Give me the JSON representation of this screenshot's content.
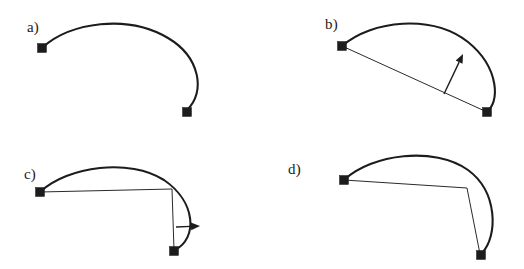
{
  "figure": {
    "background_color": "#ffffff",
    "ink_color": "#1c1c1c",
    "thin_ink_color": "#2a2a2a",
    "width": 524,
    "height": 269
  },
  "panels": [
    {
      "id": "a",
      "label": "a)",
      "label_x": 27,
      "label_y": 32,
      "description": "Smooth open curve between two square endpoints, no chord, no arrow",
      "curve_path": "M 42,48 C 70,22 128,14 168,38 C 200,57 206,92 187,110",
      "chord_path": "",
      "arrow": null,
      "nodes": [
        {
          "name": "start-node",
          "x": 42,
          "y": 48
        },
        {
          "name": "end-node",
          "x": 187,
          "y": 112
        }
      ]
    },
    {
      "id": "b",
      "label": "b)",
      "label_x": 325,
      "label_y": 29,
      "description": "Curve with straight chord joining endpoints and a normal arrow pointing outward from the chord",
      "curve_path": "M 342,46 C 372,20 432,14 468,42 C 500,68 500,104 486,112",
      "chord_path": "M 342,46 L 487,112",
      "arrow": {
        "name": "normal-arrow-b",
        "x1": 444,
        "y1": 94,
        "x2": 463,
        "y2": 54,
        "head_size": 9
      },
      "nodes": [
        {
          "name": "start-node",
          "x": 342,
          "y": 46
        },
        {
          "name": "end-node",
          "x": 487,
          "y": 112
        }
      ]
    },
    {
      "id": "c",
      "label": "c)",
      "label_x": 24,
      "label_y": 179,
      "description": "Curve with an L-shaped polyline chord and a horizontal arrow pointing right",
      "curve_path": "M 40,192 C 68,166 130,158 164,180 C 196,202 198,238 175,250",
      "chord_path": "M 40,192 L 172,189 L 174,250",
      "arrow": {
        "name": "normal-arrow-c",
        "x1": 176,
        "y1": 227,
        "x2": 200,
        "y2": 226,
        "head_size": 9
      },
      "nodes": [
        {
          "name": "start-node",
          "x": 40,
          "y": 192
        },
        {
          "name": "end-node",
          "x": 174,
          "y": 251
        }
      ]
    },
    {
      "id": "d",
      "label": "d)",
      "label_x": 288,
      "label_y": 174,
      "description": "Curve with polyline chord bent toward the moved endpoint, no arrow",
      "curve_path": "M 344,180 C 372,154 434,146 468,170 C 498,192 498,236 482,253",
      "chord_path": "M 344,180 L 467,188 L 480,254",
      "arrow": null,
      "nodes": [
        {
          "name": "start-node",
          "x": 344,
          "y": 180
        },
        {
          "name": "end-node",
          "x": 481,
          "y": 255
        }
      ]
    }
  ],
  "node_style": {
    "size": 9,
    "color": "#1c1c1c"
  }
}
